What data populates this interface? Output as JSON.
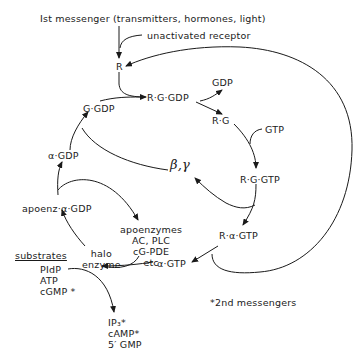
{
  "nodes": {
    "first_messenger": "Ist messenger (transmitters, hormones, light)",
    "unactivated_receptor": "unactivated receptor",
    "R": "R",
    "RGGDP": "R·G·GDP",
    "GDP_release": "GDP",
    "RG": "R·G",
    "GTP": "GTP",
    "RGGTP": "R·G·GTP",
    "beta_gamma": "β,γ",
    "RaGTP": "R·α·GTP",
    "aGTP": "α·GTP",
    "GGDP": "G·GDP",
    "aGDP": "α·GDP",
    "apoenz_aGDP": "apoenz·α·GDP",
    "apoenzymes": "apoenzymes\nAC, PLC\ncG-PDE\netc",
    "holo_enzyme": "halo\nenzyme",
    "substrates_heading": "substrates",
    "substrates": "PIdP\nATP\ncGMP *",
    "products": "IP₃*\ncAMP*\n5′ GMP",
    "footnote": "*2nd messengers"
  }
}
